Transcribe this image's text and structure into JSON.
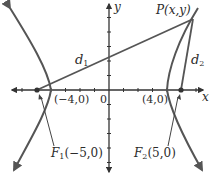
{
  "diagram": {
    "colors": {
      "curve": "#555555",
      "axis": "#333333",
      "text": "#2b2b2b",
      "background": "#ffffff"
    },
    "axes": {
      "x_label": "x",
      "y_label": "y",
      "origin_label": "0"
    },
    "point_P": {
      "label": "P(x,y)"
    },
    "distances": {
      "d1": {
        "label": "d",
        "subscript": "1"
      },
      "d2": {
        "label": "d",
        "subscript": "2"
      }
    },
    "vertices": [
      {
        "label": "(−4,0)"
      },
      {
        "label": "(4,0)"
      }
    ],
    "foci": [
      {
        "name": "F",
        "subscript": "1",
        "coords": "(−5,0)"
      },
      {
        "name": "F",
        "subscript": "2",
        "coords": "(5,0)"
      }
    ]
  }
}
